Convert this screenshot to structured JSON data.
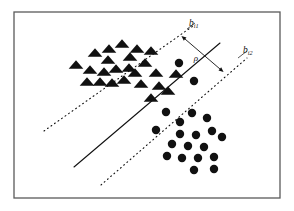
{
  "figure": {
    "background_color": "#ffffff",
    "border": {
      "color": "#5a5a5a",
      "width": 1.3,
      "x": 14,
      "y": 12,
      "w": 266,
      "h": 186
    },
    "labels": {
      "margin_symbol": "ρ",
      "boundary_upper_base": "b",
      "boundary_upper_sub": "i1",
      "boundary_lower_base": "b",
      "boundary_lower_sub": "i2"
    },
    "lines": {
      "decision_boundary": {
        "name": "decision-boundary",
        "style": "solid",
        "color": "#111111",
        "width": 1.1,
        "x1": 74,
        "y1": 167,
        "x2": 220,
        "y2": 43
      },
      "margin_upper": {
        "name": "margin-boundary-upper",
        "style": "dotted",
        "color": "#111111",
        "width": 1.1,
        "x1": 44,
        "y1": 131,
        "x2": 193,
        "y2": 26
      },
      "margin_lower": {
        "name": "margin-boundary-lower",
        "style": "dotted",
        "color": "#111111",
        "width": 1.1,
        "x1": 101,
        "y1": 185,
        "x2": 247,
        "y2": 58
      },
      "margin_arrow": {
        "name": "margin-arrow",
        "style": "solid",
        "color": "#111111",
        "width": 0.9,
        "x1": 185,
        "y1": 39,
        "x2": 220,
        "y2": 69
      }
    },
    "label_leaders": {
      "upper": {
        "x1": 188,
        "y1": 28,
        "x2": 196,
        "y2": 22
      },
      "lower": {
        "x1": 240,
        "y1": 56,
        "x2": 249,
        "y2": 50
      }
    },
    "label_positions": {
      "upper": {
        "x": 189,
        "y": 26
      },
      "lower": {
        "x": 243,
        "y": 53
      },
      "rho": {
        "x": 196,
        "y": 60
      }
    }
  },
  "chart_data": {
    "type": "scatter",
    "xlabel": "",
    "ylabel": "",
    "xlim": [
      0,
      294
    ],
    "ylim": [
      0,
      211
    ],
    "grid": false,
    "legend": false,
    "annotations": [
      {
        "text": "ρ",
        "x": 196,
        "y": 60,
        "meaning": "margin width"
      },
      {
        "text": "b_i1",
        "x": 189,
        "y": 26,
        "meaning": "upper margin boundary"
      },
      {
        "text": "b_i2",
        "x": 243,
        "y": 53,
        "meaning": "lower margin boundary"
      }
    ],
    "series": [
      {
        "name": "class-triangle",
        "marker": "triangle",
        "color": "#111111",
        "size": 6.2,
        "points": [
          [
            76,
            65
          ],
          [
            95,
            53
          ],
          [
            108,
            60
          ],
          [
            109,
            49
          ],
          [
            122,
            44
          ],
          [
            130,
            57
          ],
          [
            137,
            49
          ],
          [
            90,
            70
          ],
          [
            104,
            72
          ],
          [
            116,
            69
          ],
          [
            129,
            68
          ],
          [
            100,
            82
          ],
          [
            112,
            83
          ],
          [
            124,
            80
          ],
          [
            135,
            73
          ],
          [
            87,
            82
          ],
          [
            145,
            63
          ],
          [
            151,
            51
          ],
          [
            156,
            73
          ],
          [
            141,
            84
          ],
          [
            159,
            86
          ],
          [
            168,
            91
          ],
          [
            151,
            98
          ],
          [
            176,
            74
          ]
        ]
      },
      {
        "name": "class-circle",
        "marker": "circle",
        "color": "#111111",
        "size": 5.4,
        "points": [
          [
            179,
            63
          ],
          [
            194,
            81
          ],
          [
            166,
            112
          ],
          [
            180,
            122
          ],
          [
            156,
            130
          ],
          [
            192,
            113
          ],
          [
            207,
            118
          ],
          [
            180,
            134
          ],
          [
            196,
            135
          ],
          [
            212,
            131
          ],
          [
            172,
            144
          ],
          [
            188,
            146
          ],
          [
            204,
            147
          ],
          [
            222,
            137
          ],
          [
            182,
            158
          ],
          [
            198,
            158
          ],
          [
            214,
            157
          ],
          [
            167,
            156
          ],
          [
            194,
            170
          ],
          [
            214,
            169
          ]
        ]
      }
    ]
  }
}
